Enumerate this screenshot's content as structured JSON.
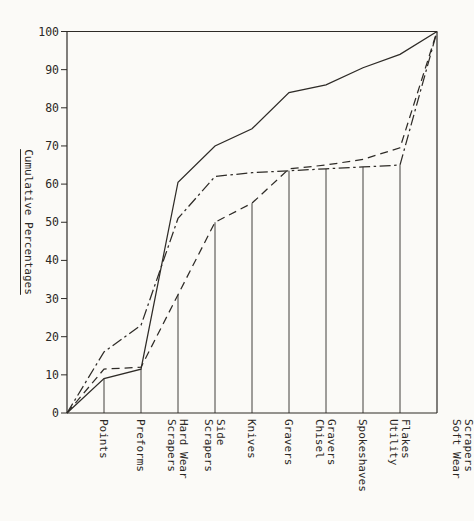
{
  "figure": {
    "paper_color": "#fbfaf7",
    "ink_color": "#2e2b27"
  },
  "chart_data": {
    "type": "line",
    "title": "",
    "ylabel": "Cumulative Percentages",
    "xlabel": "",
    "ylim": [
      0,
      100
    ],
    "yticks": [
      0,
      10,
      20,
      30,
      40,
      50,
      60,
      70,
      80,
      90,
      100
    ],
    "grid": false,
    "legend": "none",
    "frame": "closed box, lines start at origin of y-axis and end at top-right corner",
    "categories": [
      {
        "label": "Points",
        "columns": [
          "Points"
        ]
      },
      {
        "label": "Preforms",
        "columns": [
          "Preforms"
        ]
      },
      {
        "label": "Hard Wear Scrapers",
        "columns": [
          "Scrapers",
          "Hard Wear"
        ]
      },
      {
        "label": "Side Scrapers",
        "columns": [
          "Scrapers",
          "Side"
        ]
      },
      {
        "label": "Knives",
        "columns": [
          "Knives"
        ]
      },
      {
        "label": "Gravers",
        "columns": [
          "Gravers"
        ]
      },
      {
        "label": "Chisel Gravers",
        "columns": [
          "Chisel",
          "Gravers"
        ]
      },
      {
        "label": "Spokeshaves",
        "columns": [
          "Spokeshaves"
        ]
      },
      {
        "label": "Utility Flakes",
        "columns": [
          "Utility",
          "Flakes"
        ]
      },
      {
        "label": "Soft Wear Scrapers",
        "columns": [
          "Soft Wear",
          "Scrapers"
        ]
      }
    ],
    "series": [
      {
        "name": "solid-line-series",
        "style": "solid",
        "values_from_origin": [
          0,
          9,
          11.5,
          60.5,
          70,
          74.5,
          84,
          86,
          90.5,
          94,
          100
        ]
      },
      {
        "name": "dash-dot-line-series",
        "style": "dashdot",
        "values_from_origin": [
          0,
          16,
          23,
          51,
          62,
          63,
          63.5,
          64,
          64.5,
          65,
          100
        ]
      },
      {
        "name": "dashed-line-series",
        "style": "dashed",
        "values_from_origin": [
          0,
          11.5,
          12,
          31,
          50,
          55,
          64,
          65,
          66.5,
          69.5,
          100
        ]
      }
    ],
    "drop_lines_at_categories": [
      9,
      11.5,
      31,
      50,
      55,
      63.5,
      64,
      64.5,
      65
    ]
  }
}
